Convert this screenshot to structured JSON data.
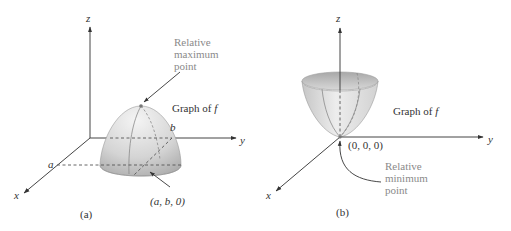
{
  "figure": {
    "panels": [
      {
        "id": "a",
        "caption": "(a)",
        "surface": "dome (downward-opening paraboloid)",
        "axes": {
          "z": "z",
          "y": "y",
          "x": "x"
        },
        "ticks": {
          "x_tick": "a",
          "y_tick": "b"
        },
        "graph_label_prefix": "Graph of ",
        "graph_label_var": "f",
        "point_label": "(a, b, 0)",
        "callout": [
          "Relative",
          "maximum",
          "point"
        ]
      },
      {
        "id": "b",
        "caption": "(b)",
        "surface": "bowl (upward-opening paraboloid)",
        "axes": {
          "z": "z",
          "y": "y",
          "x": "x"
        },
        "graph_label_prefix": "Graph of ",
        "graph_label_var": "f",
        "point_label": "(0, 0, 0)",
        "callout": [
          "Relative",
          "minimum",
          "point"
        ]
      }
    ],
    "colors": {
      "axis": "#444444",
      "callout_text": "#8a8a8a",
      "surface_light": "#f2f2f2",
      "surface_dark": "#b5b5b5"
    }
  }
}
